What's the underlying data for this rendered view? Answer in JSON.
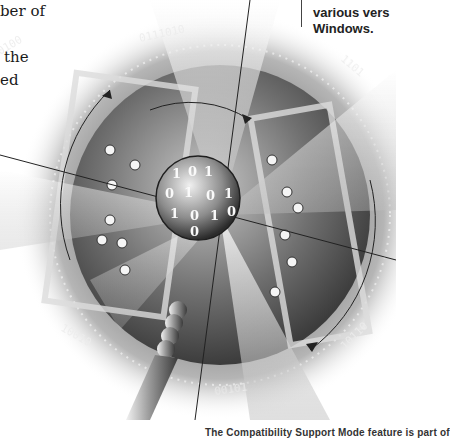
{
  "body_text": {
    "lines": [
      {
        "text": "ber of",
        "top": 0
      },
      {
        "text": "the",
        "top": 46
      },
      {
        "text": "ed",
        "top": 69
      }
    ]
  },
  "sidebar": {
    "lines": [
      "various vers",
      "Windows."
    ]
  },
  "illustration": {
    "subject": "magnifying-glass-over-binary-sphere",
    "binary_labels": [
      "0111010",
      "11010",
      "0100",
      "1101",
      "10010111",
      "00101",
      "10110",
      "01001"
    ],
    "sphere_digits": [
      "1",
      "0",
      "1",
      "0",
      "1",
      "0",
      "1",
      "0",
      "1",
      "0",
      "1",
      "0"
    ],
    "palette": {
      "light": "#e8e8e8",
      "mid": "#9a9a9a",
      "dark": "#3a3a3a",
      "bg": "#ffffff"
    }
  },
  "caption": {
    "text": "The Compatibility Support Mode feature is part of"
  }
}
